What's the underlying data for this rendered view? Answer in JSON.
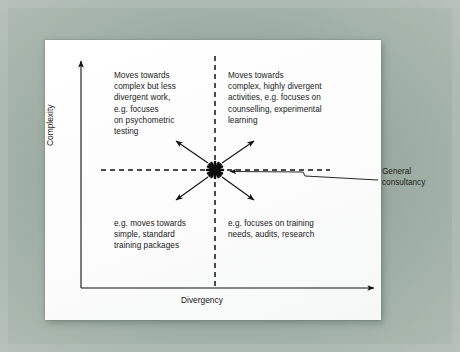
{
  "figure": {
    "title_in_image": "",
    "axes": {
      "x_label": "Divergency",
      "y_label": "Complexity"
    },
    "hub": {
      "name": "general-consultancy-hub",
      "marker": "starburst"
    },
    "quadrants": {
      "top_left": "Moves towards\ncomplex but less\ndivergent work,\ne.g. focuses\non psychometric\ntesting",
      "top_right": "Moves towards\ncomplex, highly divergent\nactivities, e.g. focuses on\ncounselling, experimental\nlearning",
      "bottom_left": "e.g. moves towards\nsimple, standard\ntraining packages",
      "bottom_right": "e.g. focuses on training\nneeds, audits, research"
    },
    "callout": {
      "label": "General\nconsultancy"
    },
    "colors": {
      "ink": "#1a1a1a",
      "paper": "#fdfdfd",
      "mount": "#aebbb2"
    }
  }
}
